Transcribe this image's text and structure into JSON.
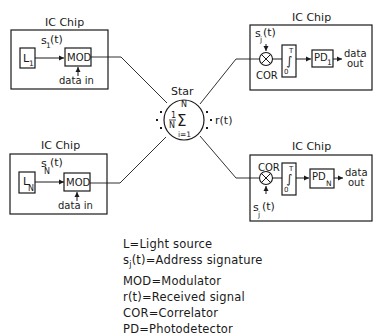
{
  "diagram": {
    "colors": {
      "line": "#1a1a1a",
      "background": "#ffffff"
    },
    "transmitters": [
      {
        "chip_label": "IC Chip",
        "source": "L",
        "source_sub": "1",
        "signature": "s",
        "signature_sub": "1",
        "signature_arg": "(t)",
        "modulator": "MOD",
        "input": "data in"
      },
      {
        "chip_label": "IC Chip",
        "source": "L",
        "source_sub": "N",
        "signature": "s",
        "signature_sub": "N",
        "signature_arg": "(t)",
        "modulator": "MOD",
        "input": "data in"
      }
    ],
    "receivers": [
      {
        "chip_label": "IC Chip",
        "signature": "s",
        "signature_sub": "j",
        "signature_arg": "(t)",
        "correlator": "COR",
        "integrator_upper": "T",
        "integrator_lower": "0",
        "detector": "PD",
        "detector_sub": "1",
        "output_line1": "data",
        "output_line2": "out"
      },
      {
        "chip_label": "IC Chip",
        "signature": "s",
        "signature_sub": "j",
        "signature_arg": "(t)",
        "correlator": "COR",
        "integrator_upper": "T",
        "integrator_lower": "0",
        "detector": "PD",
        "detector_sub": "N",
        "output_line1": "data",
        "output_line2": "out"
      }
    ],
    "star": {
      "label": "Star",
      "fraction_num": "1",
      "fraction_den": "N",
      "sum_symbol": "Σ",
      "sum_upper": "N",
      "sum_lower": "i=1",
      "output": "r(t)"
    },
    "legend": [
      {
        "key": "L",
        "key_sub": "",
        "key_suffix": "",
        "value": "Light source"
      },
      {
        "key": "s",
        "key_sub": "j",
        "key_suffix": "(t)",
        "value": "Address signature"
      },
      {
        "key": "MOD",
        "key_sub": "",
        "key_suffix": "",
        "value": "Modulator"
      },
      {
        "key": "r(t)",
        "key_sub": "",
        "key_suffix": "",
        "value": "Received signal"
      },
      {
        "key": "COR",
        "key_sub": "",
        "key_suffix": "",
        "value": "Correlator"
      },
      {
        "key": "PD",
        "key_sub": "",
        "key_suffix": "",
        "value": "Photodetector"
      }
    ]
  }
}
